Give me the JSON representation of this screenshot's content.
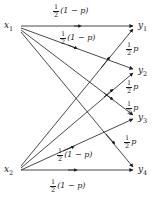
{
  "figure": {
    "type": "bipartite-channel-diagram",
    "stroke_color": "#1a1a1a",
    "background_color": "#ffffff"
  },
  "nodes": {
    "inputs": [
      {
        "id": "x1",
        "base": "x",
        "sub": "1",
        "x": 12,
        "y": 26
      },
      {
        "id": "x2",
        "base": "x",
        "sub": "2",
        "x": 12,
        "y": 170
      }
    ],
    "outputs": [
      {
        "id": "y1",
        "base": "y",
        "sub": "1",
        "x": 140,
        "y": 26
      },
      {
        "id": "y2",
        "base": "y",
        "sub": "2",
        "x": 140,
        "y": 71
      },
      {
        "id": "y3",
        "base": "y",
        "sub": "3",
        "x": 140,
        "y": 118
      },
      {
        "id": "y4",
        "base": "y",
        "sub": "4",
        "x": 140,
        "y": 170
      }
    ]
  },
  "edges": [
    {
      "id": "x1-y1",
      "from": "x1",
      "to": "y1",
      "label": "half-one-minus-p"
    },
    {
      "id": "x1-y2",
      "from": "x1",
      "to": "y2",
      "label": "half-one-minus-p"
    },
    {
      "id": "x1-y3",
      "from": "x1",
      "to": "y3",
      "label": "half-p"
    },
    {
      "id": "x1-y4",
      "from": "x1",
      "to": "y4",
      "label": "half-p"
    },
    {
      "id": "x2-y1",
      "from": "x2",
      "to": "y1",
      "label": "half-p"
    },
    {
      "id": "x2-y2",
      "from": "x2",
      "to": "y2",
      "label": "half-p"
    },
    {
      "id": "x2-y3",
      "from": "x2",
      "to": "y3",
      "label": "half-one-minus-p"
    },
    {
      "id": "x2-y4",
      "from": "x2",
      "to": "y4",
      "label": "half-one-minus-p"
    }
  ],
  "labels": [
    {
      "id": "label-top",
      "numerator": "1",
      "denominator": "2",
      "tail": "(1 − p)",
      "x": 53,
      "y": 6
    },
    {
      "id": "label-upper-mid",
      "numerator": "1",
      "denominator": "2",
      "tail": "(1 − p)",
      "x": 60,
      "y": 33
    },
    {
      "id": "label-p-top",
      "numerator": "1",
      "denominator": "2",
      "tail": "p",
      "x": 126,
      "y": 44
    },
    {
      "id": "label-p-upper",
      "numerator": "1",
      "denominator": "2",
      "tail": "p",
      "x": 126,
      "y": 82
    },
    {
      "id": "label-p-lower",
      "numerator": "1",
      "denominator": "2",
      "tail": "p",
      "x": 126,
      "y": 103
    },
    {
      "id": "label-p-bottom",
      "numerator": "1",
      "denominator": "2",
      "tail": "p",
      "x": 124,
      "y": 137
    },
    {
      "id": "label-lower-mid",
      "numerator": "1",
      "denominator": "2",
      "tail": "(1 − p)",
      "x": 57,
      "y": 150
    },
    {
      "id": "label-bottom",
      "numerator": "1",
      "denominator": "2",
      "tail": "(1 − p)",
      "x": 50,
      "y": 181
    }
  ]
}
